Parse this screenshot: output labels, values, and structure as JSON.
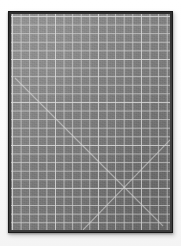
{
  "scene": {
    "title": "Self-healing cutting mat",
    "subject": "cutting-mat",
    "background_color": "#ffffff",
    "width": 181,
    "height": 246
  },
  "mat": {
    "label": "gray self-healing cutting mat",
    "surface_color": "#7e7e7e",
    "frame_color": "#3a3a3a",
    "grid_line_color": "#cdcdcd",
    "major_grid_line_color": "#dedede",
    "diagonal_line_color": "#d7d7d7",
    "orientation": "portrait",
    "frame_thickness_px": 3,
    "grid_cell_px": 8.6,
    "major_grid_every": 5,
    "grid_columns": 19,
    "grid_rows": 25,
    "bounds": {
      "left": 8,
      "top": 11,
      "width": 165,
      "height": 222
    }
  },
  "diagonals": [
    {
      "name": "primary-diagonal",
      "x1": 4,
      "y1": 64,
      "x2": 152,
      "y2": 212
    },
    {
      "name": "secondary-diagonal",
      "x1": 72,
      "y1": 216,
      "x2": 159,
      "y2": 126
    }
  ],
  "colors": {
    "backdrop": "#ffffff",
    "mat_surface": "#7e7e7e",
    "mat_frame": "#3a3a3a",
    "grid": "#cdcdcd"
  }
}
